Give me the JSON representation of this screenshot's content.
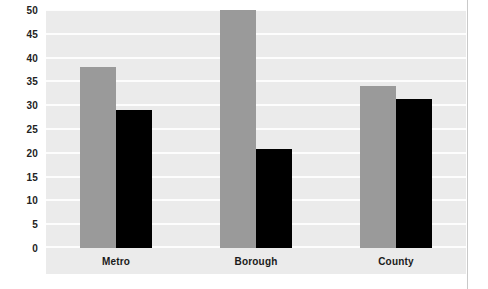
{
  "chart_data": {
    "type": "bar",
    "title": "",
    "subtitle": "",
    "xlabel": "",
    "ylabel": "",
    "categories": [
      "Metro",
      "Borough",
      "County"
    ],
    "series": [
      {
        "name": "Series 1",
        "color": "#9a9a9a",
        "values": [
          38,
          50,
          34
        ]
      },
      {
        "name": "Series 2",
        "color": "#000000",
        "values": [
          29,
          20.7,
          31.4
        ]
      }
    ],
    "ylim": [
      0,
      50
    ],
    "ytick_labels": [
      "50",
      "45",
      "40",
      "35",
      "30",
      "25",
      "20",
      "15",
      "10",
      "5",
      "0"
    ],
    "ytick_values": [
      50,
      45,
      40,
      35,
      30,
      25,
      20,
      15,
      10,
      5,
      0
    ],
    "ytick_step": 5,
    "grid": true,
    "grid_axis": "y",
    "legend": false,
    "legend_position": "none",
    "plot_background": "#ebebeb",
    "gridline_color": "#fdfdfd",
    "figure_background": "#ffffff"
  }
}
